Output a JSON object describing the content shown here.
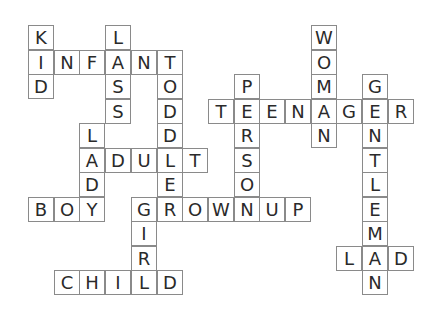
{
  "puzzle": {
    "type": "crossword",
    "grid_origin": {
      "x": 28,
      "y": 25
    },
    "cell_size": {
      "w": 25.7,
      "h": 24.5
    },
    "words": [
      {
        "word": "KID",
        "dir": "down",
        "row": 0,
        "col": 0
      },
      {
        "word": "INFANT",
        "dir": "across",
        "row": 1,
        "col": 0
      },
      {
        "word": "LASS",
        "dir": "down",
        "row": 0,
        "col": 3
      },
      {
        "word": "TODDLER",
        "dir": "down",
        "row": 1,
        "col": 5
      },
      {
        "word": "LADY",
        "dir": "down",
        "row": 4,
        "col": 2
      },
      {
        "word": "ADULT",
        "dir": "across",
        "row": 5,
        "col": 2
      },
      {
        "word": "BOY",
        "dir": "across",
        "row": 7,
        "col": 0
      },
      {
        "word": "GROWNUP",
        "dir": "across",
        "row": 7,
        "col": 4
      },
      {
        "word": "GIRL",
        "dir": "down",
        "row": 7,
        "col": 4
      },
      {
        "word": "CHILD",
        "dir": "across",
        "row": 10,
        "col": 1
      },
      {
        "word": "PERSON",
        "dir": "down",
        "row": 2,
        "col": 8
      },
      {
        "word": "TEENAGER",
        "dir": "across",
        "row": 3,
        "col": 7
      },
      {
        "word": "WOMAN",
        "dir": "down",
        "row": 0,
        "col": 11
      },
      {
        "word": "GENTLEMAN",
        "dir": "down",
        "row": 2,
        "col": 13
      },
      {
        "word": "LAD",
        "dir": "across",
        "row": 9,
        "col": 12
      }
    ]
  }
}
